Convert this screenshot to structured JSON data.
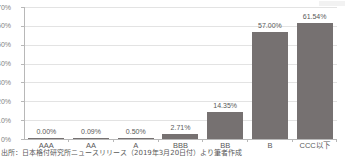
{
  "chart_data": {
    "type": "bar",
    "title": "",
    "xlabel": "",
    "ylabel": "",
    "categories": [
      "AAA",
      "AA",
      "A",
      "BBB",
      "BB",
      "B",
      "CCC以下"
    ],
    "values": [
      0.0,
      0.09,
      0.5,
      2.71,
      14.35,
      57.0,
      61.54
    ],
    "value_labels": [
      "0.00%",
      "0.09%",
      "0.50%",
      "2.71%",
      "14.35%",
      "57.00%",
      "61.54%"
    ],
    "ylim": [
      0,
      70
    ],
    "ytick_values": [
      0,
      10,
      20,
      30,
      40,
      50,
      60,
      70
    ],
    "ytick_labels": [
      "0%",
      "10%",
      "20%",
      "30%",
      "40%",
      "50%",
      "60%",
      "70%"
    ],
    "grid": true,
    "legend": null,
    "bar_color": "#767171",
    "gridline_color": "#e3e3e3",
    "axis_color": "#b8b8b8",
    "label_color": "#595959"
  },
  "source": {
    "text": "出所：日本格付研究所ニュースリリース（2019年3月20日付）より筆者作成"
  }
}
